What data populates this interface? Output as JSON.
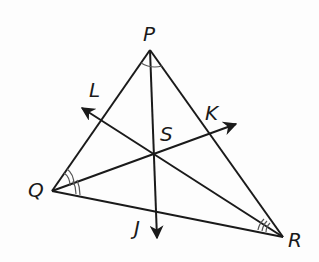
{
  "diagram": {
    "type": "triangle-angle-bisectors",
    "stroke_color": "#1a1a1a",
    "arc_color": "#555555",
    "vertices": [
      {
        "name": "P",
        "x": 150,
        "y": 50
      },
      {
        "name": "Q",
        "x": 52,
        "y": 191
      },
      {
        "name": "R",
        "x": 283,
        "y": 237
      }
    ],
    "incenter": {
      "name": "S",
      "x": 154,
      "y": 153
    },
    "rays": [
      {
        "name": "J",
        "from": "P",
        "tip_x": 157,
        "tip_y": 238
      },
      {
        "name": "K",
        "from": "Q",
        "tip_x": 236,
        "tip_y": 124
      },
      {
        "name": "L",
        "from": "R",
        "tip_x": 82,
        "tip_y": 108
      }
    ],
    "labels": {
      "P": "P",
      "Q": "Q",
      "R": "R",
      "S": "S",
      "J": "J",
      "K": "K",
      "L": "L"
    },
    "angle_marks": {
      "P": "single arc",
      "Q": "double arc",
      "R": "triple arc"
    }
  }
}
